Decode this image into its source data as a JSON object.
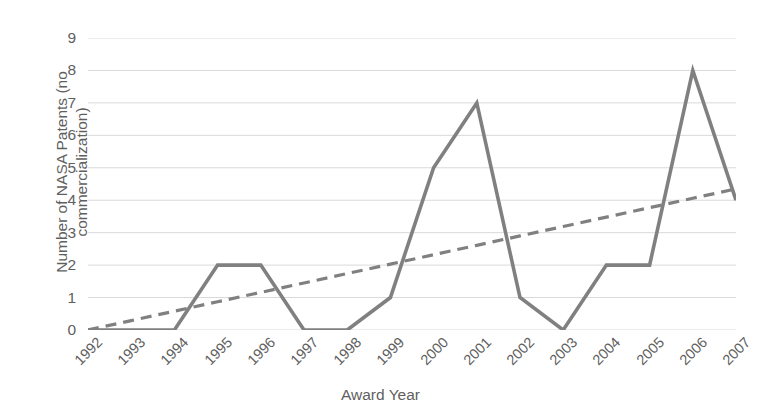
{
  "chart_data": {
    "type": "line",
    "title": "",
    "xlabel": "Award Year",
    "ylabel": "Number of NASA Patents (no commercialization)",
    "ylabel_lines": [
      "Number of NASA Patents (no",
      "commercialization)"
    ],
    "categories": [
      "1992",
      "1993",
      "1994",
      "1995",
      "1996",
      "1997",
      "1998",
      "1999",
      "2000",
      "2001",
      "2002",
      "2003",
      "2004",
      "2005",
      "2006",
      "2007"
    ],
    "series": [
      {
        "name": "Number of NASA Patents (no commercialization)",
        "style": "solid",
        "color": "#808080",
        "values": [
          0,
          0,
          0,
          2,
          2,
          0,
          0,
          1,
          5,
          7,
          1,
          0,
          2,
          2,
          8,
          4
        ]
      },
      {
        "name": "Linear trendline",
        "style": "dashed",
        "color": "#808080",
        "values": [
          0.0,
          0.29,
          0.58,
          0.87,
          1.16,
          1.45,
          1.74,
          2.03,
          2.32,
          2.61,
          2.9,
          3.19,
          3.48,
          3.77,
          4.06,
          4.35
        ]
      }
    ],
    "ylim": [
      0,
      9
    ],
    "yticks": [
      0,
      1,
      2,
      3,
      4,
      5,
      6,
      7,
      8,
      9
    ],
    "ytick_labels": [
      "0",
      "1",
      "2",
      "3",
      "4",
      "5",
      "6",
      "7",
      "8",
      "9"
    ],
    "xlim_index": [
      0,
      15
    ],
    "grid": "horizontal",
    "grid_color": "#d9d9d9",
    "legend": "none",
    "background": "#ffffff",
    "axis_text_color": "#5f5f5f",
    "xtick_rotation": -45
  }
}
